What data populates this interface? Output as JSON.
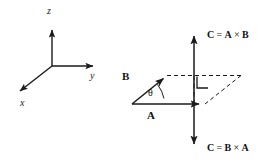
{
  "figure": {
    "background_color": "#ffffff",
    "stroke_color": "#1a1a1a"
  },
  "axes": {
    "name": "right-handed-coordinate-axes",
    "origin": {
      "x": 52,
      "y": 66
    },
    "labels": {
      "z": "z",
      "y": "y",
      "x": "x"
    },
    "z_tip": {
      "x": 52,
      "y": 26
    },
    "y_tip": {
      "x": 97,
      "y": 66
    },
    "x_tip": {
      "x": 16,
      "y": 94
    }
  },
  "cross_product": {
    "name": "cross-product-diagram",
    "origin": {
      "x": 132,
      "y": 104
    },
    "vector_a": {
      "label": "A",
      "tip": {
        "x": 203,
        "y": 104
      }
    },
    "vector_b": {
      "label": "B",
      "tip": {
        "x": 167,
        "y": 75
      }
    },
    "angle": {
      "label": "θ"
    },
    "right_angle_marker": "right-angle",
    "result_up": {
      "text": "C = A × B",
      "c": "C",
      "eq": "=",
      "first": "A",
      "times": "×",
      "second": "B"
    },
    "result_down": {
      "text": "C = B × A",
      "c": "C",
      "eq": "=",
      "first": "B",
      "times": "×",
      "second": "A"
    },
    "c_axis": {
      "top_tip": {
        "x": 194,
        "y": 32
      },
      "bottom_tip": {
        "x": 194,
        "y": 148
      }
    },
    "parallelogram": {
      "style": "dashed",
      "corners": [
        {
          "x": 167,
          "y": 75
        },
        {
          "x": 240,
          "y": 75
        },
        {
          "x": 203,
          "y": 104
        },
        {
          "x": 132,
          "y": 104
        }
      ]
    }
  }
}
